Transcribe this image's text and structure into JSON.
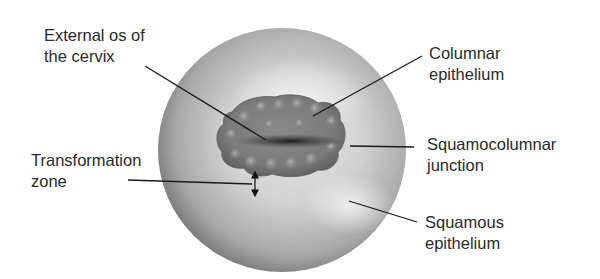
{
  "labels": {
    "external_os": "External os of\nthe cervix",
    "columnar": "Columnar\nepithelium",
    "squamocolumnar": "Squamocolumnar\njunction",
    "transformation": "Transformation\nzone",
    "squamous": "Squamous\nepithelium"
  },
  "colors": {
    "background": "#ffffff",
    "leader_line": "#1a1a1a",
    "text": "#2a2a2a"
  }
}
